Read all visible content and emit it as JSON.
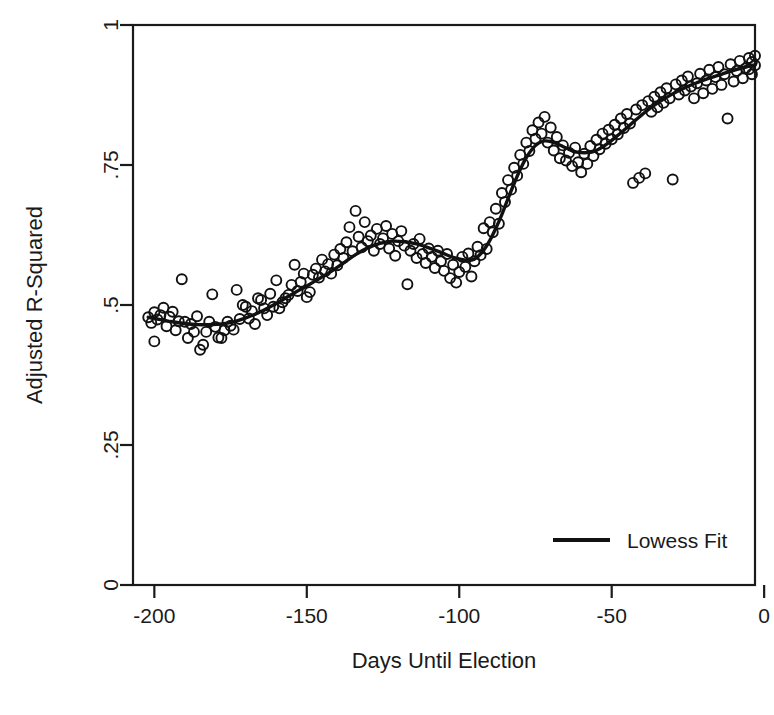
{
  "figure": {
    "width": 774,
    "height": 715,
    "background": "#ffffff",
    "ink_color": "#111111"
  },
  "plot_area": {
    "left": 133,
    "right": 755,
    "top": 25,
    "bottom": 585
  },
  "chart_data": {
    "type": "scatter",
    "title": "",
    "subtitle": "",
    "xlabel": "Days Until Election",
    "ylabel": "Adjusted R-Squared",
    "xlim": [
      -207,
      -3
    ],
    "ylim": [
      0,
      1
    ],
    "xticks": [
      -200,
      -150,
      -100,
      -50,
      0
    ],
    "xticklabels": [
      "-200",
      "-150",
      "-100",
      "-50",
      "0"
    ],
    "yticks": [
      0,
      0.25,
      0.5,
      0.75,
      1
    ],
    "yticklabels": [
      "0",
      ".25",
      ".5",
      ".75",
      "1"
    ],
    "grid": false,
    "legend_position": "lower right",
    "legend": [
      {
        "label": "Lowess Fit",
        "marker": "line",
        "color": "#111111"
      }
    ],
    "marker_style": {
      "shape": "circle-open",
      "radius": 5,
      "fill": "none",
      "edge_color": "#111111"
    },
    "series": [
      {
        "name": "Observed Adjusted R-Squared",
        "type": "scatter",
        "points": [
          [
            -202,
            0.478
          ],
          [
            -201,
            0.468
          ],
          [
            -200,
            0.487
          ],
          [
            -200,
            0.435
          ],
          [
            -199,
            0.474
          ],
          [
            -198,
            0.482
          ],
          [
            -197,
            0.495
          ],
          [
            -196,
            0.462
          ],
          [
            -195,
            0.479
          ],
          [
            -194,
            0.488
          ],
          [
            -193,
            0.455
          ],
          [
            -192,
            0.471
          ],
          [
            -191,
            0.546
          ],
          [
            -190,
            0.47
          ],
          [
            -189,
            0.441
          ],
          [
            -188,
            0.466
          ],
          [
            -187,
            0.452
          ],
          [
            -186,
            0.48
          ],
          [
            -185,
            0.42
          ],
          [
            -184,
            0.429
          ],
          [
            -183,
            0.452
          ],
          [
            -182,
            0.47
          ],
          [
            -181,
            0.519
          ],
          [
            -180,
            0.461
          ],
          [
            -179,
            0.442
          ],
          [
            -178,
            0.441
          ],
          [
            -177,
            0.455
          ],
          [
            -176,
            0.47
          ],
          [
            -175,
            0.463
          ],
          [
            -174,
            0.456
          ],
          [
            -173,
            0.527
          ],
          [
            -172,
            0.475
          ],
          [
            -171,
            0.5
          ],
          [
            -170,
            0.497
          ],
          [
            -169,
            0.476
          ],
          [
            -168,
            0.489
          ],
          [
            -167,
            0.466
          ],
          [
            -166,
            0.512
          ],
          [
            -165,
            0.509
          ],
          [
            -164,
            0.494
          ],
          [
            -163,
            0.482
          ],
          [
            -162,
            0.52
          ],
          [
            -161,
            0.497
          ],
          [
            -160,
            0.544
          ],
          [
            -159,
            0.494
          ],
          [
            -158,
            0.505
          ],
          [
            -157,
            0.512
          ],
          [
            -156,
            0.518
          ],
          [
            -155,
            0.536
          ],
          [
            -154,
            0.572
          ],
          [
            -153,
            0.525
          ],
          [
            -152,
            0.541
          ],
          [
            -151,
            0.556
          ],
          [
            -150,
            0.514
          ],
          [
            -149,
            0.523
          ],
          [
            -148,
            0.554
          ],
          [
            -147,
            0.565
          ],
          [
            -146,
            0.549
          ],
          [
            -145,
            0.581
          ],
          [
            -144,
            0.56
          ],
          [
            -143,
            0.573
          ],
          [
            -142,
            0.556
          ],
          [
            -141,
            0.59
          ],
          [
            -140,
            0.571
          ],
          [
            -139,
            0.6
          ],
          [
            -138,
            0.584
          ],
          [
            -137,
            0.612
          ],
          [
            -136,
            0.639
          ],
          [
            -135,
            0.596
          ],
          [
            -134,
            0.668
          ],
          [
            -133,
            0.622
          ],
          [
            -132,
            0.603
          ],
          [
            -131,
            0.648
          ],
          [
            -130,
            0.614
          ],
          [
            -129,
            0.624
          ],
          [
            -128,
            0.597
          ],
          [
            -127,
            0.636
          ],
          [
            -126,
            0.609
          ],
          [
            -125,
            0.619
          ],
          [
            -124,
            0.641
          ],
          [
            -123,
            0.601
          ],
          [
            -122,
            0.627
          ],
          [
            -121,
            0.588
          ],
          [
            -120,
            0.614
          ],
          [
            -119,
            0.632
          ],
          [
            -118,
            0.606
          ],
          [
            -117,
            0.537
          ],
          [
            -116,
            0.597
          ],
          [
            -115,
            0.609
          ],
          [
            -114,
            0.584
          ],
          [
            -113,
            0.618
          ],
          [
            -112,
            0.591
          ],
          [
            -111,
            0.575
          ],
          [
            -110,
            0.601
          ],
          [
            -109,
            0.586
          ],
          [
            -108,
            0.566
          ],
          [
            -107,
            0.597
          ],
          [
            -106,
            0.578
          ],
          [
            -105,
            0.561
          ],
          [
            -104,
            0.591
          ],
          [
            -103,
            0.548
          ],
          [
            -102,
            0.572
          ],
          [
            -101,
            0.54
          ],
          [
            -100,
            0.559
          ],
          [
            -99,
            0.586
          ],
          [
            -98,
            0.568
          ],
          [
            -97,
            0.592
          ],
          [
            -96,
            0.551
          ],
          [
            -95,
            0.578
          ],
          [
            -94,
            0.604
          ],
          [
            -93,
            0.589
          ],
          [
            -92,
            0.637
          ],
          [
            -91,
            0.6
          ],
          [
            -90,
            0.648
          ],
          [
            -89,
            0.63
          ],
          [
            -88,
            0.672
          ],
          [
            -87,
            0.645
          ],
          [
            -86,
            0.7
          ],
          [
            -85,
            0.684
          ],
          [
            -84,
            0.723
          ],
          [
            -83,
            0.706
          ],
          [
            -82,
            0.745
          ],
          [
            -81,
            0.731
          ],
          [
            -80,
            0.768
          ],
          [
            -79,
            0.752
          ],
          [
            -78,
            0.79
          ],
          [
            -77,
            0.775
          ],
          [
            -76,
            0.812
          ],
          [
            -75,
            0.797
          ],
          [
            -74,
            0.826
          ],
          [
            -73,
            0.806
          ],
          [
            -72,
            0.836
          ],
          [
            -71,
            0.79
          ],
          [
            -70,
            0.817
          ],
          [
            -69,
            0.776
          ],
          [
            -68,
            0.8
          ],
          [
            -67,
            0.762
          ],
          [
            -66,
            0.785
          ],
          [
            -65,
            0.758
          ],
          [
            -64,
            0.772
          ],
          [
            -63,
            0.748
          ],
          [
            -62,
            0.781
          ],
          [
            -61,
            0.755
          ],
          [
            -60,
            0.737
          ],
          [
            -59,
            0.77
          ],
          [
            -58,
            0.752
          ],
          [
            -57,
            0.784
          ],
          [
            -56,
            0.766
          ],
          [
            -55,
            0.795
          ],
          [
            -54,
            0.778
          ],
          [
            -53,
            0.806
          ],
          [
            -52,
            0.788
          ],
          [
            -51,
            0.813
          ],
          [
            -50,
            0.796
          ],
          [
            -49,
            0.822
          ],
          [
            -48,
            0.805
          ],
          [
            -47,
            0.833
          ],
          [
            -46,
            0.816
          ],
          [
            -45,
            0.841
          ],
          [
            -44,
            0.824
          ],
          [
            -43,
            0.718
          ],
          [
            -42,
            0.849
          ],
          [
            -41,
            0.727
          ],
          [
            -40,
            0.857
          ],
          [
            -39,
            0.735
          ],
          [
            -38,
            0.864
          ],
          [
            -37,
            0.845
          ],
          [
            -36,
            0.872
          ],
          [
            -35,
            0.853
          ],
          [
            -34,
            0.88
          ],
          [
            -33,
            0.861
          ],
          [
            -32,
            0.887
          ],
          [
            -31,
            0.869
          ],
          [
            -30,
            0.724
          ],
          [
            -29,
            0.894
          ],
          [
            -28,
            0.876
          ],
          [
            -27,
            0.901
          ],
          [
            -26,
            0.883
          ],
          [
            -25,
            0.908
          ],
          [
            -24,
            0.89
          ],
          [
            -23,
            0.869
          ],
          [
            -22,
            0.896
          ],
          [
            -21,
            0.913
          ],
          [
            -20,
            0.878
          ],
          [
            -19,
            0.901
          ],
          [
            -18,
            0.92
          ],
          [
            -17,
            0.886
          ],
          [
            -16,
            0.907
          ],
          [
            -15,
            0.925
          ],
          [
            -14,
            0.893
          ],
          [
            -13,
            0.912
          ],
          [
            -12,
            0.833
          ],
          [
            -11,
            0.93
          ],
          [
            -10,
            0.899
          ],
          [
            -9,
            0.918
          ],
          [
            -8,
            0.936
          ],
          [
            -7,
            0.905
          ],
          [
            -6,
            0.923
          ],
          [
            -5,
            0.941
          ],
          [
            -4,
            0.912
          ],
          [
            -3,
            0.928
          ],
          [
            -3,
            0.945
          ],
          [
            -4,
            0.934
          ],
          [
            -5,
            0.921
          ]
        ]
      },
      {
        "name": "Lowess Fit",
        "type": "line",
        "points": [
          [
            -202,
            0.478
          ],
          [
            -198,
            0.474
          ],
          [
            -194,
            0.47
          ],
          [
            -190,
            0.467
          ],
          [
            -186,
            0.465
          ],
          [
            -182,
            0.465
          ],
          [
            -178,
            0.466
          ],
          [
            -174,
            0.47
          ],
          [
            -170,
            0.477
          ],
          [
            -166,
            0.486
          ],
          [
            -162,
            0.497
          ],
          [
            -158,
            0.509
          ],
          [
            -154,
            0.522
          ],
          [
            -150,
            0.534
          ],
          [
            -146,
            0.547
          ],
          [
            -142,
            0.56
          ],
          [
            -138,
            0.575
          ],
          [
            -134,
            0.59
          ],
          [
            -130,
            0.602
          ],
          [
            -126,
            0.61
          ],
          [
            -122,
            0.614
          ],
          [
            -118,
            0.613
          ],
          [
            -114,
            0.609
          ],
          [
            -110,
            0.602
          ],
          [
            -106,
            0.594
          ],
          [
            -102,
            0.585
          ],
          [
            -98,
            0.58
          ],
          [
            -96,
            0.58
          ],
          [
            -94,
            0.586
          ],
          [
            -92,
            0.598
          ],
          [
            -90,
            0.615
          ],
          [
            -88,
            0.637
          ],
          [
            -86,
            0.662
          ],
          [
            -84,
            0.69
          ],
          [
            -82,
            0.717
          ],
          [
            -80,
            0.742
          ],
          [
            -78,
            0.763
          ],
          [
            -76,
            0.779
          ],
          [
            -74,
            0.789
          ],
          [
            -72,
            0.793
          ],
          [
            -70,
            0.792
          ],
          [
            -68,
            0.788
          ],
          [
            -66,
            0.783
          ],
          [
            -64,
            0.778
          ],
          [
            -62,
            0.774
          ],
          [
            -60,
            0.772
          ],
          [
            -58,
            0.772
          ],
          [
            -56,
            0.774
          ],
          [
            -54,
            0.779
          ],
          [
            -52,
            0.786
          ],
          [
            -50,
            0.794
          ],
          [
            -46,
            0.812
          ],
          [
            -42,
            0.831
          ],
          [
            -38,
            0.849
          ],
          [
            -34,
            0.864
          ],
          [
            -30,
            0.877
          ],
          [
            -26,
            0.888
          ],
          [
            -22,
            0.897
          ],
          [
            -18,
            0.905
          ],
          [
            -14,
            0.912
          ],
          [
            -10,
            0.919
          ],
          [
            -6,
            0.925
          ],
          [
            -3,
            0.929
          ]
        ]
      }
    ]
  }
}
